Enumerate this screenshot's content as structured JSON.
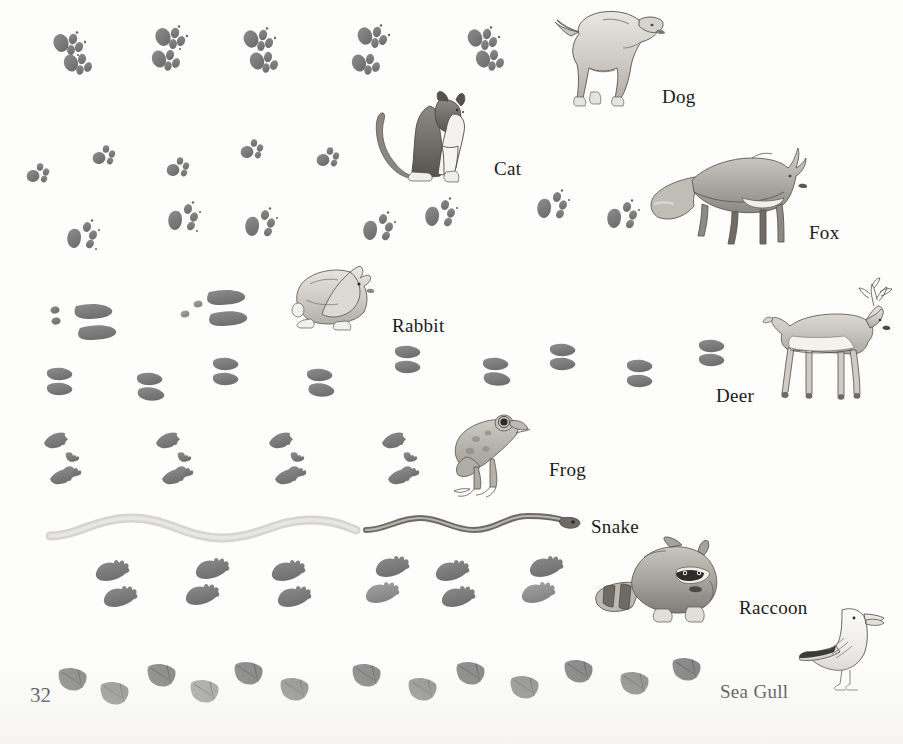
{
  "page": {
    "number": "32",
    "background_color": "#fdfdfc",
    "ink_color": "#1a1a1a",
    "track_fill": "#7e7e7e",
    "track_fill_light": "#9a9a9a"
  },
  "rows": [
    {
      "id": "dog",
      "label": "Dog",
      "label_x": 662,
      "label_y": 86,
      "animal_name": "dog-illustration",
      "track_type": "paw-four-toe",
      "track_count": 10,
      "description": "Dog paw prints in paired diagonal sets"
    },
    {
      "id": "cat",
      "label": "Cat",
      "label_x": 494,
      "label_y": 158,
      "animal_name": "cat-illustration",
      "track_type": "paw-round-small",
      "track_count": 6,
      "description": "Small round cat paw prints without claw marks"
    },
    {
      "id": "fox",
      "label": "Fox",
      "label_x": 809,
      "label_y": 222,
      "animal_name": "fox-illustration",
      "track_type": "paw-triangular-pad",
      "track_count": 7,
      "description": "Fox paw prints with triangular heel pad and claws"
    },
    {
      "id": "rabbit",
      "label": "Rabbit",
      "label_x": 392,
      "label_y": 315,
      "animal_name": "rabbit-illustration",
      "track_type": "elongated-hind-and-dots",
      "track_count": 3,
      "description": "Rabbit tracks: two long hind feet and two small front prints"
    },
    {
      "id": "deer",
      "label": "Deer",
      "label_x": 716,
      "label_y": 385,
      "animal_name": "deer-illustration",
      "track_type": "cloven-hoof",
      "track_count": 7,
      "description": "Deer cloven hoof prints, two teardrop halves"
    },
    {
      "id": "frog",
      "label": "Frog",
      "label_x": 549,
      "label_y": 459,
      "animal_name": "frog-illustration",
      "track_type": "frog-webbed",
      "track_count": 4,
      "description": "Frog tracks: long hind foot prints with small starred front prints"
    },
    {
      "id": "snake",
      "label": "Snake",
      "label_x": 591,
      "label_y": 516,
      "animal_name": "snake-illustration",
      "track_type": "wavy-trail",
      "track_count": 1,
      "description": "Wavy trail left by a snake sliding across the ground"
    },
    {
      "id": "raccoon",
      "label": "Raccoon",
      "label_x": 739,
      "label_y": 597,
      "animal_name": "raccoon-illustration",
      "track_type": "hand-five-finger",
      "track_count": 11,
      "description": "Raccoon hand-like prints with five long fingers"
    },
    {
      "id": "seagull",
      "label": "Sea Gull",
      "label_x": 720,
      "label_y": 681,
      "animal_name": "seagull-illustration",
      "track_type": "webbed-foot",
      "track_count": 12,
      "description": "Sea gull webbed triangular foot prints"
    }
  ]
}
